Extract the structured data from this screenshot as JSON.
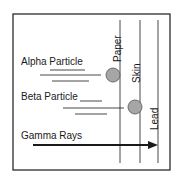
{
  "diagram": {
    "particles": [
      {
        "label": "Alpha Particle",
        "stopped_by": "Paper"
      },
      {
        "label": "Beta Particle",
        "stopped_by": "Skin"
      },
      {
        "label": "Gamma Rays",
        "stopped_by": "Lead"
      }
    ],
    "barriers": [
      {
        "label": "Paper"
      },
      {
        "label": "Skin"
      },
      {
        "label": "Lead"
      }
    ],
    "colors": {
      "line": "#1a1a1a",
      "circle_fill": "#a6a6a6",
      "circle_stroke": "#555555"
    }
  }
}
